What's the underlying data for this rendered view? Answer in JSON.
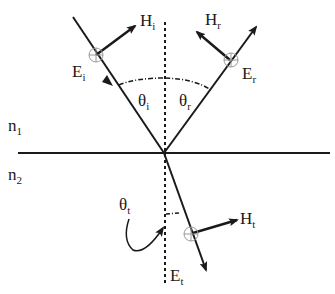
{
  "diagram": {
    "type": "reflection-refraction-interface",
    "media": {
      "upper": {
        "symbol": "n",
        "subscript": "1"
      },
      "lower": {
        "symbol": "n",
        "subscript": "2"
      }
    },
    "rays": {
      "incident": {
        "E": {
          "symbol": "E",
          "subscript": "i"
        },
        "H": {
          "symbol": "H",
          "subscript": "i"
        },
        "angle": {
          "symbol": "θ",
          "subscript": "i"
        }
      },
      "reflected": {
        "E": {
          "symbol": "E",
          "subscript": "r"
        },
        "H": {
          "symbol": "H",
          "subscript": "r"
        },
        "angle": {
          "symbol": "θ",
          "subscript": "r"
        }
      },
      "transmitted": {
        "E": {
          "symbol": "E",
          "subscript": "t"
        },
        "H": {
          "symbol": "H",
          "subscript": "t"
        },
        "angle": {
          "symbol": "θ",
          "subscript": "t"
        }
      }
    },
    "colors": {
      "line": "#1a1a1a",
      "marker": "#9a9a9a"
    }
  }
}
